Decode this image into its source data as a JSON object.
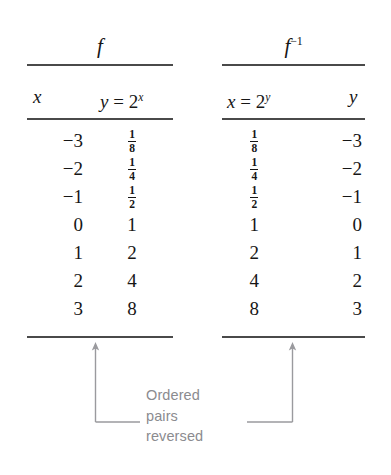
{
  "figure": {
    "caption_lines": [
      "Ordered",
      "pairs",
      "reversed"
    ]
  },
  "tables": [
    {
      "id": "forward",
      "title": "f",
      "title_exponent": "",
      "columns": [
        {
          "label_main": "x",
          "label_eq": "",
          "label_base": "",
          "label_exp": ""
        },
        {
          "label_main": "y",
          "label_eq": "=",
          "label_base": "2",
          "label_exp": "x"
        }
      ],
      "rows": [
        {
          "c1": "−3",
          "c2": {
            "type": "fraction",
            "num": "1",
            "den": "8"
          }
        },
        {
          "c1": "−2",
          "c2": {
            "type": "fraction",
            "num": "1",
            "den": "4"
          }
        },
        {
          "c1": "−1",
          "c2": {
            "type": "fraction",
            "num": "1",
            "den": "2"
          }
        },
        {
          "c1": "0",
          "c2": {
            "type": "text",
            "value": "1"
          }
        },
        {
          "c1": "1",
          "c2": {
            "type": "text",
            "value": "2"
          }
        },
        {
          "c1": "2",
          "c2": {
            "type": "text",
            "value": "4"
          }
        },
        {
          "c1": "3",
          "c2": {
            "type": "text",
            "value": "8"
          }
        }
      ]
    },
    {
      "id": "inverse",
      "title": "f",
      "title_exponent": "−1",
      "columns": [
        {
          "label_main": "x",
          "label_eq": "=",
          "label_base": "2",
          "label_exp": "y"
        },
        {
          "label_main": "y",
          "label_eq": "",
          "label_base": "",
          "label_exp": ""
        }
      ],
      "rows": [
        {
          "c1": {
            "type": "fraction",
            "num": "1",
            "den": "8"
          },
          "c2": "−3"
        },
        {
          "c1": {
            "type": "fraction",
            "num": "1",
            "den": "4"
          },
          "c2": "−2"
        },
        {
          "c1": {
            "type": "fraction",
            "num": "1",
            "den": "2"
          },
          "c2": "−1"
        },
        {
          "c1": {
            "type": "text",
            "value": "1"
          },
          "c2": "0"
        },
        {
          "c1": {
            "type": "text",
            "value": "2"
          },
          "c2": "1"
        },
        {
          "c1": {
            "type": "text",
            "value": "4"
          },
          "c2": "2"
        },
        {
          "c1": {
            "type": "text",
            "value": "8"
          },
          "c2": "3"
        }
      ]
    }
  ],
  "colors": {
    "rule": "#4a4a4a",
    "text": "#161616",
    "caption": "#8b8b8f",
    "connector": "#9a9a9e"
  }
}
